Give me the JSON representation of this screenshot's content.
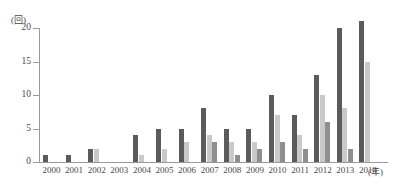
{
  "axes": {
    "y_unit_label": "(回)",
    "x_unit_label": "(年)",
    "y_ticks": [
      "0",
      "5",
      "10",
      "15",
      "20"
    ]
  },
  "chart_data": {
    "type": "bar",
    "title": "",
    "subtitle": "",
    "xlabel": "(年)",
    "ylabel": "(回)",
    "ylim": [
      0,
      20
    ],
    "yticks": [
      0,
      5,
      10,
      15,
      20
    ],
    "grid": false,
    "legend": "none",
    "categories": [
      "2000",
      "2001",
      "2002",
      "2003",
      "2004",
      "2005",
      "2006",
      "2007",
      "2008",
      "2009",
      "2010",
      "2011",
      "2012",
      "2013",
      "2014"
    ],
    "series": [
      {
        "name": "series-1",
        "color": "#5b5b5b",
        "values": [
          1,
          1,
          2,
          0,
          4,
          5,
          5,
          8,
          5,
          5,
          10,
          7,
          13,
          20,
          21
        ]
      },
      {
        "name": "series-2",
        "color": "#c9c9c9",
        "values": [
          0,
          0,
          2,
          0,
          1,
          2,
          3,
          4,
          3,
          3,
          7,
          4,
          10,
          8,
          15
        ]
      },
      {
        "name": "series-3",
        "color": "#8f8f8f",
        "values": [
          0,
          0,
          0,
          0,
          0,
          0,
          0,
          3,
          1,
          2,
          3,
          2,
          6,
          2,
          0
        ]
      }
    ]
  }
}
